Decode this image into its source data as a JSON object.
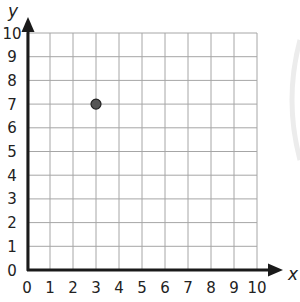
{
  "chart_data": {
    "type": "scatter",
    "title": "",
    "xlabel": "x",
    "ylabel": "y",
    "xlim": [
      0,
      10
    ],
    "ylim": [
      0,
      10
    ],
    "grid": true,
    "x_ticks": [
      "0",
      "1",
      "2",
      "3",
      "4",
      "5",
      "6",
      "7",
      "8",
      "9",
      "10"
    ],
    "y_ticks": [
      "0",
      "1",
      "2",
      "3",
      "4",
      "5",
      "6",
      "7",
      "8",
      "9",
      "10"
    ],
    "points": [
      {
        "x": 3,
        "y": 7
      }
    ],
    "colors": {
      "grid": "#a6a6a6",
      "axis": "#1a1a1a",
      "point_fill": "#555555",
      "point_stroke": "#222222"
    }
  },
  "axes": {
    "x_label": "x",
    "y_label": "y"
  }
}
